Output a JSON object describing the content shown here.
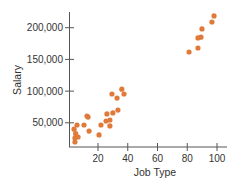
{
  "chart_data": {
    "type": "scatter",
    "title": "",
    "xlabel": "Job Type",
    "ylabel": "Salary",
    "xlim": [
      0,
      105
    ],
    "ylim": [
      11000,
      230000
    ],
    "xticks": [
      20,
      40,
      60,
      80,
      100
    ],
    "xtick_labels": [
      "20",
      "40",
      "60",
      "80",
      "100"
    ],
    "yticks": [
      50000,
      100000,
      150000,
      200000
    ],
    "ytick_labels": [
      "50,000",
      "100,000",
      "150,000",
      "200,000"
    ],
    "grid": false,
    "legend": null,
    "point_color": "#e07a3a",
    "points": [
      {
        "x": 3.9,
        "y": 40000
      },
      {
        "x": 5.9,
        "y": 46500
      },
      {
        "x": 4.5,
        "y": 26000
      },
      {
        "x": 5.2,
        "y": 29000
      },
      {
        "x": 6.6,
        "y": 27600
      },
      {
        "x": 4.5,
        "y": 19700
      },
      {
        "x": 5.0,
        "y": 33000
      },
      {
        "x": 10.6,
        "y": 46500
      },
      {
        "x": 12.6,
        "y": 60700
      },
      {
        "x": 13.3,
        "y": 59000
      },
      {
        "x": 14.0,
        "y": 37000
      },
      {
        "x": 20.7,
        "y": 30800
      },
      {
        "x": 22.0,
        "y": 46500
      },
      {
        "x": 25.4,
        "y": 52800
      },
      {
        "x": 26.0,
        "y": 64000
      },
      {
        "x": 28.0,
        "y": 54400
      },
      {
        "x": 28.0,
        "y": 45000
      },
      {
        "x": 30.0,
        "y": 65500
      },
      {
        "x": 29.4,
        "y": 95400
      },
      {
        "x": 32.8,
        "y": 89000
      },
      {
        "x": 33.4,
        "y": 70000
      },
      {
        "x": 36.0,
        "y": 103000
      },
      {
        "x": 37.5,
        "y": 95400
      },
      {
        "x": 81.2,
        "y": 161700
      },
      {
        "x": 87.2,
        "y": 168000
      },
      {
        "x": 87.2,
        "y": 183800
      },
      {
        "x": 89.2,
        "y": 185000
      },
      {
        "x": 89.9,
        "y": 198000
      },
      {
        "x": 96.6,
        "y": 209000
      },
      {
        "x": 98.0,
        "y": 218500
      }
    ]
  }
}
